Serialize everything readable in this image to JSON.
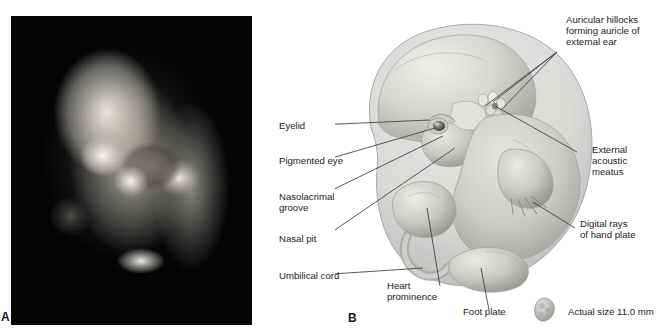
{
  "figure": {
    "panels": [
      {
        "id": "A",
        "label": "A",
        "type": "photograph",
        "caption": ""
      },
      {
        "id": "B",
        "label": "B",
        "type": "illustration",
        "caption": ""
      }
    ]
  },
  "labels": {
    "eyelid": "Eyelid",
    "pigmented_eye": "Pigmented eye",
    "nasolacrimal_groove_line1": "Nasolacrimal",
    "nasolacrimal_groove_line2": "groove",
    "nasal_pit": "Nasal pit",
    "umbilical_cord": "Umbilical cord",
    "auricular_hillocks_line1": "Auricular hillocks",
    "auricular_hillocks_line2": "forming auricle of",
    "auricular_hillocks_line3": "external ear",
    "external_acoustic_meatus_line1": "External",
    "external_acoustic_meatus_line2": "acoustic",
    "external_acoustic_meatus_line3": "meatus",
    "digital_rays_line1": "Digital rays",
    "digital_rays_line2": "of hand plate",
    "heart_prominence_line1": "Heart",
    "heart_prominence_line2": "prominence",
    "foot_plate": "Foot plate",
    "actual_size": "Actual size 11.0 mm"
  },
  "colors": {
    "background": "#ffffff",
    "text": "#1c1c1c",
    "leader_line": "#404040",
    "photo_background": "#070707",
    "embryo_light": "#e8e7e3",
    "embryo_mid": "#c6c5c1",
    "embryo_shadow": "#9a9997",
    "embryo_dark": "#7b7a78"
  }
}
